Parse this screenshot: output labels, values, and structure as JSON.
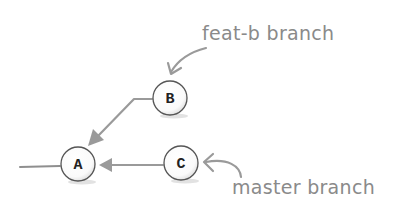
{
  "diagram": {
    "type": "git-commit-graph",
    "colors": {
      "arrow": "#9a9a9a",
      "annotation_text": "#8a8a8a",
      "node_stroke": "#555555",
      "node_fill": "#ffffff",
      "node_shadow": "#d8d8d8",
      "node_label": "#222222"
    },
    "nodes": [
      {
        "id": "A",
        "label": "A",
        "cx": 78,
        "cy": 164
      },
      {
        "id": "B",
        "label": "B",
        "cx": 170,
        "cy": 98
      },
      {
        "id": "C",
        "label": "C",
        "cx": 181,
        "cy": 163
      }
    ],
    "edges": [
      {
        "from": "B",
        "to": "A"
      },
      {
        "from": "C",
        "to": "A"
      }
    ],
    "annotations": [
      {
        "id": "feat-b",
        "text": "feat-b branch",
        "points_to": "B"
      },
      {
        "id": "master",
        "text": "master branch",
        "points_to": "C"
      }
    ]
  }
}
